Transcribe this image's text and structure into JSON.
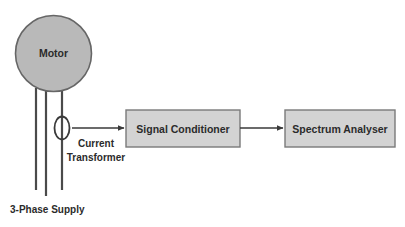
{
  "diagram": {
    "background_color": "#ffffff",
    "nodes": {
      "motor": {
        "label": "Motor",
        "shape": "circle",
        "fill": "#b9b9b9",
        "stroke": "#666666",
        "cx": 53.5,
        "cy": 53.5,
        "r": 38.5
      },
      "current_transformer": {
        "label_line1": "Current",
        "label_line2": "Transformer",
        "shape": "ellipse",
        "fill": "none",
        "stroke": "#3a3a3a",
        "cx": 62,
        "cy": 128,
        "rx": 7.5,
        "ry": 11.5
      },
      "signal_conditioner": {
        "label": "Signal Conditioner",
        "shape": "rect",
        "fill": "#d3d3d3",
        "stroke": "#7a7a7a",
        "x": 126,
        "y": 110,
        "width": 114,
        "height": 37
      },
      "spectrum_analyser": {
        "label": "Spectrum Analyser",
        "shape": "rect",
        "fill": "#d3d3d3",
        "stroke": "#7a7a7a",
        "x": 285,
        "y": 110,
        "width": 110,
        "height": 37
      }
    },
    "supply": {
      "label": "3-Phase Supply",
      "line_color": "#4a4a4a",
      "phases": [
        {
          "name": "phase-line-1",
          "x": 36,
          "y_top": 88,
          "y_bottom": 190
        },
        {
          "name": "phase-line-2",
          "x": 46,
          "y_top": 90,
          "y_bottom": 196
        },
        {
          "name": "phase-line-3",
          "x": 62,
          "y_top": 88,
          "y_bottom": 190
        }
      ]
    },
    "connections": [
      {
        "name": "ct-to-signal-conditioner",
        "from": "current_transformer",
        "to": "signal_conditioner",
        "x1": 72,
        "x2": 124,
        "y": 128,
        "color": "#3a3a3a"
      },
      {
        "name": "signal-conditioner-to-spectrum-analyser",
        "from": "signal_conditioner",
        "to": "spectrum_analyser",
        "x1": 240,
        "x2": 283,
        "y": 128,
        "color": "#3a3a3a"
      }
    ],
    "colors": {
      "motor_fill": "#b9b9b9",
      "box_fill": "#d3d3d3",
      "box_stroke": "#7a7a7a",
      "line": "#4a4a4a",
      "text": "#2b2b2b"
    }
  }
}
